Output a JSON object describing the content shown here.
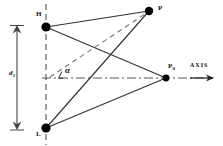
{
  "figure": {
    "type": "geometry-diagram",
    "background": "#ffffff",
    "stroke_color": "#333333",
    "node_color": "#000000",
    "width": 223,
    "height": 146
  },
  "labels": {
    "node_h": "H",
    "node_l": "L",
    "node_p": "P",
    "node_p0_main": "P",
    "node_p0_sub": "0",
    "dimension_d1_main": "d",
    "dimension_d1_sub": "1",
    "angle_alpha": "α",
    "axis": "AXIS"
  },
  "geometry": {
    "nodes": [
      {
        "name": "H",
        "x": 46,
        "y": 27,
        "radius": 4.6,
        "label": "H"
      },
      {
        "name": "L",
        "x": 46,
        "y": 128,
        "radius": 4.6,
        "label": "L"
      },
      {
        "name": "P",
        "x": 149,
        "y": 11,
        "radius": 4.2,
        "label": "P"
      },
      {
        "name": "P0",
        "x": 166,
        "y": 78,
        "radius": 3.4,
        "label": "P0"
      }
    ],
    "solid_edges": [
      {
        "from": "H",
        "to": "P"
      },
      {
        "from": "H",
        "to": "P0"
      },
      {
        "from": "L",
        "to": "P"
      },
      {
        "from": "L",
        "to": "P0"
      }
    ],
    "dashed_edges": [
      {
        "from": "angle-vertex",
        "to": "P",
        "x1": 50,
        "y1": 78,
        "x2": 149,
        "y2": 11
      }
    ],
    "vertical_dashed_axis": {
      "x": 46,
      "y1": 5,
      "y2": 144
    },
    "horizontal_dashdot_axis": {
      "y": 78,
      "x1": 44,
      "x2": 214
    },
    "axis_arrow": {
      "x1": 191,
      "y1": 78,
      "x2": 214,
      "y2": 78
    },
    "dimension_line": {
      "x": 17,
      "y_top": 27,
      "y_bottom": 128,
      "tick_half_width": 7
    },
    "angle_marker": {
      "vertex_x": 50,
      "vertex_y": 78,
      "label_x": 66,
      "label_y": 66
    }
  }
}
